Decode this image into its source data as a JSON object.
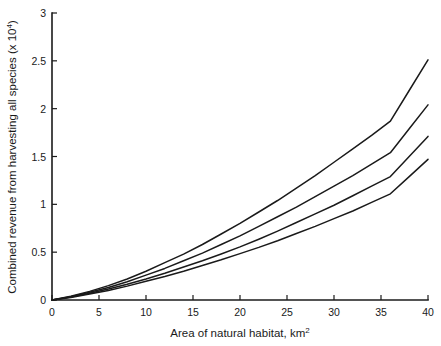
{
  "chart_data": {
    "type": "line",
    "title": "",
    "xlabel": "Area of natural habitat, km",
    "xlabel_exponent": "2",
    "ylabel": "Combined revenue from harvesting all species (x 10",
    "ylabel_exponent": "4",
    "ylabel_close": ")",
    "xlim": [
      0,
      40
    ],
    "ylim": [
      0,
      3
    ],
    "xticks": [
      0,
      5,
      10,
      15,
      20,
      25,
      30,
      35,
      40
    ],
    "xtick_labels": [
      "0",
      "5",
      "10",
      "15",
      "20",
      "25",
      "30",
      "35",
      "40"
    ],
    "yticks": [
      0,
      0.5,
      1,
      1.5,
      2,
      2.5,
      3
    ],
    "ytick_labels": [
      "0",
      "0.5",
      "1",
      "1.5",
      "2",
      "2.5",
      "3"
    ],
    "grid": false,
    "legend": "none",
    "line_color": "#1a1a1a",
    "axis_color": "#1a1a1a",
    "background": "#ffffff",
    "x": [
      0,
      2,
      4,
      6,
      8,
      10,
      12,
      14,
      16,
      18,
      20,
      22,
      24,
      26,
      28,
      30,
      32,
      34,
      36,
      38,
      40
    ],
    "series": [
      {
        "name": "curve-1",
        "end_value": 2.51,
        "values": [
          0,
          0.04,
          0.09,
          0.15,
          0.22,
          0.3,
          0.39,
          0.48,
          0.58,
          0.69,
          0.8,
          0.92,
          1.04,
          1.17,
          1.3,
          1.44,
          1.58,
          1.72,
          1.87,
          2.19,
          2.51
        ]
      },
      {
        "name": "curve-2",
        "end_value": 2.04,
        "values": [
          0,
          0.035,
          0.08,
          0.13,
          0.19,
          0.26,
          0.33,
          0.41,
          0.49,
          0.58,
          0.67,
          0.77,
          0.87,
          0.97,
          1.08,
          1.19,
          1.3,
          1.42,
          1.54,
          1.79,
          2.04
        ]
      },
      {
        "name": "curve-3",
        "end_value": 1.71,
        "values": [
          0,
          0.03,
          0.07,
          0.115,
          0.165,
          0.22,
          0.28,
          0.345,
          0.41,
          0.48,
          0.555,
          0.635,
          0.72,
          0.81,
          0.9,
          0.99,
          1.09,
          1.19,
          1.29,
          1.5,
          1.71
        ]
      },
      {
        "name": "curve-4",
        "end_value": 1.47,
        "values": [
          0,
          0.027,
          0.062,
          0.1,
          0.145,
          0.195,
          0.245,
          0.3,
          0.36,
          0.42,
          0.485,
          0.55,
          0.62,
          0.695,
          0.77,
          0.85,
          0.93,
          1.02,
          1.11,
          1.29,
          1.47
        ]
      }
    ]
  }
}
